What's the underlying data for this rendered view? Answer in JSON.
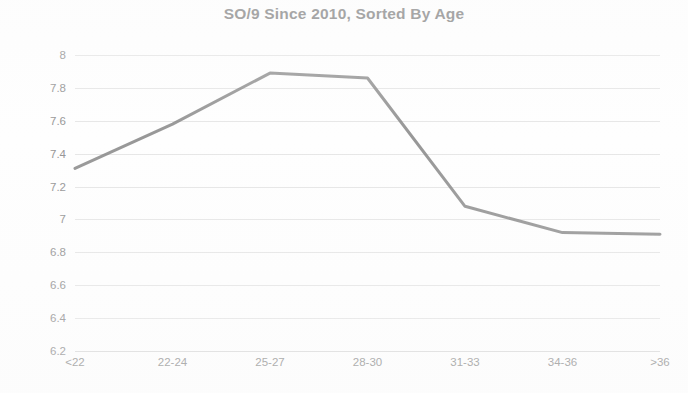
{
  "chart_data": {
    "type": "line",
    "title": "SO/9 Since 2010, Sorted By Age",
    "xlabel": "",
    "ylabel": "",
    "categories": [
      "<22",
      "22-24",
      "25-27",
      "28-30",
      "31-33",
      "34-36",
      ">36"
    ],
    "values": [
      7.31,
      7.58,
      7.89,
      7.86,
      7.08,
      6.92,
      6.91
    ],
    "series": [
      {
        "name": "SO/9",
        "values": [
          7.31,
          7.58,
          7.89,
          7.86,
          7.08,
          6.92,
          6.91
        ]
      }
    ],
    "ylim": [
      6.2,
      8.0
    ],
    "ytick_values": [
      8,
      7.8,
      7.6,
      7.4,
      7.2,
      7,
      6.8,
      6.6,
      6.4,
      6.2
    ],
    "ytick_labels": [
      "8",
      "7.8",
      "7.6",
      "7.4",
      "7.2",
      "7",
      "6.8",
      "6.6",
      "6.4",
      "6.2"
    ],
    "grid": true,
    "grid_axis": "y",
    "legend": false,
    "legend_position": "none",
    "line_color": "#808080",
    "line_width": 3,
    "markers": false,
    "background_color": "#ffffff",
    "gridline_color": "#e2e2e2",
    "text_color": "#8a8a8a",
    "title_color": "#6f6f6f"
  }
}
